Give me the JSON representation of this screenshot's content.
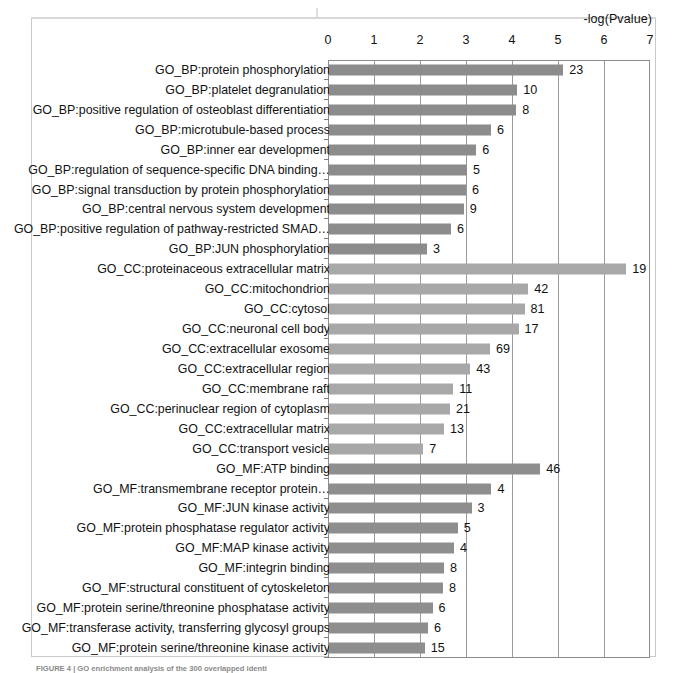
{
  "figure": {
    "caption_fragment": "FIGURE 4 | GO enrichment analysis of the 300 overlapped identi"
  },
  "chart_data": {
    "type": "bar",
    "orientation": "horizontal",
    "title": "",
    "xlabel": "-log(Pvalue)",
    "ylabel": "",
    "xlim": [
      0,
      7
    ],
    "xticks": [
      0,
      1,
      2,
      3,
      4,
      5,
      6,
      7
    ],
    "grid": true,
    "legend": "none",
    "value_label_note": "number at bar end = gene count",
    "colors": {
      "bp": "#8c8c8c",
      "cc": "#a8a8a8",
      "mf": "#8e8e8e",
      "axis": "#8c8c8c",
      "grid": "#9a9a9a"
    },
    "categories": [
      "GO_BP:protein phosphorylation",
      "GO_BP:platelet degranulation",
      "GO_BP:positive regulation of osteoblast differentiation",
      "GO_BP:microtubule-based process",
      "GO_BP:inner ear development",
      "GO_BP:regulation of sequence-specific DNA binding…",
      "GO_BP:signal transduction by protein phosphorylation",
      "GO_BP:central nervous system development",
      "GO_BP:positive regulation of pathway-restricted SMAD…",
      "GO_BP:JUN phosphorylation",
      "GO_CC:proteinaceous extracellular matrix",
      "GO_CC:mitochondrion",
      "GO_CC:cytosol",
      "GO_CC:neuronal cell body",
      "GO_CC:extracellular exosome",
      "GO_CC:extracellular region",
      "GO_CC:membrane raft",
      "GO_CC:perinuclear region of cytoplasm",
      "GO_CC:extracellular matrix",
      "GO_CC:transport vesicle",
      "GO_MF:ATP binding",
      "GO_MF:transmembrane receptor protein…",
      "GO_MF:JUN kinase activity",
      "GO_MF:protein phosphatase regulator activity",
      "GO_MF:MAP kinase activity",
      "GO_MF:integrin binding",
      "GO_MF:structural constituent of cytoskeleton",
      "GO_MF:protein serine/threonine phosphatase activity",
      "GO_MF:transferase activity, transferring glycosyl groups",
      "GO_MF:protein serine/threonine kinase activity"
    ],
    "values": [
      5.09,
      4.09,
      4.07,
      3.52,
      3.2,
      3.0,
      2.98,
      2.93,
      2.65,
      2.13,
      6.46,
      4.33,
      4.25,
      4.12,
      3.5,
      3.07,
      2.7,
      2.63,
      2.5,
      2.05,
      4.59,
      3.53,
      3.1,
      2.8,
      2.72,
      2.5,
      2.48,
      2.25,
      2.15,
      2.08
    ],
    "counts": [
      "23",
      "10",
      "8",
      "6",
      "6",
      "5",
      "6",
      "9",
      "6",
      "3",
      "19",
      "42",
      "81",
      "17",
      "69",
      "43",
      "11",
      "21",
      "13",
      "7",
      "46",
      "4",
      "3",
      "5",
      "4",
      "8",
      "8",
      "6",
      "6",
      "15"
    ],
    "groups": [
      "bp",
      "bp",
      "bp",
      "bp",
      "bp",
      "bp",
      "bp",
      "bp",
      "bp",
      "bp",
      "cc",
      "cc",
      "cc",
      "cc",
      "cc",
      "cc",
      "cc",
      "cc",
      "cc",
      "cc",
      "mf",
      "mf",
      "mf",
      "mf",
      "mf",
      "mf",
      "mf",
      "mf",
      "mf",
      "mf"
    ]
  }
}
